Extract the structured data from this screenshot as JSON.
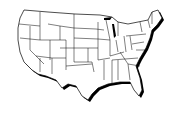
{
  "map": {
    "title": "United States",
    "style": "line-art",
    "fill_color": "#ffffff",
    "stroke_color": "#000000",
    "shadow_color": "#000000",
    "regions": [
      "contiguous-us-states"
    ]
  }
}
